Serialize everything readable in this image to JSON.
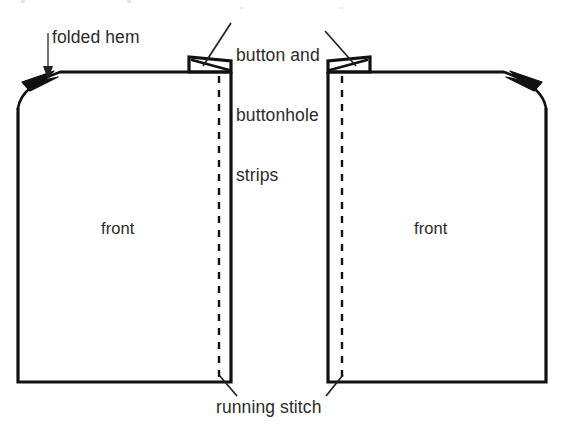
{
  "figure": {
    "background_color": "#ffffff",
    "ink_color": "#111111",
    "width": 564,
    "height": 427
  },
  "labels": {
    "folded_hem": "folded hem",
    "button_strips": "button and\nbuttonhole\nstrips",
    "button_strips_lines": [
      "button and",
      "buttonhole",
      "strips"
    ],
    "front_left": "front",
    "front_right": "front",
    "running_stitch": "running stitch"
  },
  "parts": {
    "left_panel": {
      "name": "front",
      "label": "front",
      "has_folded_hem": true,
      "folded_hem_side": "left",
      "has_button_strip": true,
      "button_strip_side": "right",
      "has_running_stitch": true,
      "running_stitch_side": "right"
    },
    "right_panel": {
      "name": "front",
      "label": "front",
      "has_folded_hem": true,
      "folded_hem_side": "right",
      "has_button_strip": true,
      "button_strip_side": "left",
      "has_running_stitch": true,
      "running_stitch_side": "left"
    }
  },
  "annotations": [
    {
      "id": "folded-hem",
      "text": "folded hem",
      "points_to": "left-panel-top-left-fold"
    },
    {
      "id": "button-and-buttonhole-strips",
      "text": "button and buttonhole strips",
      "points_to": "both-panel-top-strips"
    },
    {
      "id": "running-stitch",
      "text": "running stitch",
      "points_to": "both-panel-bottom-dashed-lines"
    }
  ]
}
